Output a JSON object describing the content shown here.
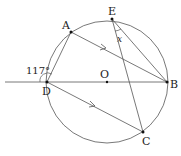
{
  "diagram": {
    "points": {
      "A": {
        "label": "A",
        "x": 71,
        "y": 32
      },
      "E": {
        "label": "E",
        "x": 112,
        "y": 19
      },
      "B": {
        "label": "B",
        "x": 167,
        "y": 82
      },
      "D": {
        "label": "D",
        "x": 47,
        "y": 82
      },
      "C": {
        "label": "C",
        "x": 143,
        "y": 132
      },
      "O": {
        "label": "O",
        "x": 107,
        "y": 82
      }
    },
    "circle": {
      "cx": 107,
      "cy": 82,
      "r": 61
    },
    "angle_label": "117°",
    "unknown_angle": "x",
    "colors": {
      "stroke": "#444444",
      "text": "#222222"
    }
  }
}
